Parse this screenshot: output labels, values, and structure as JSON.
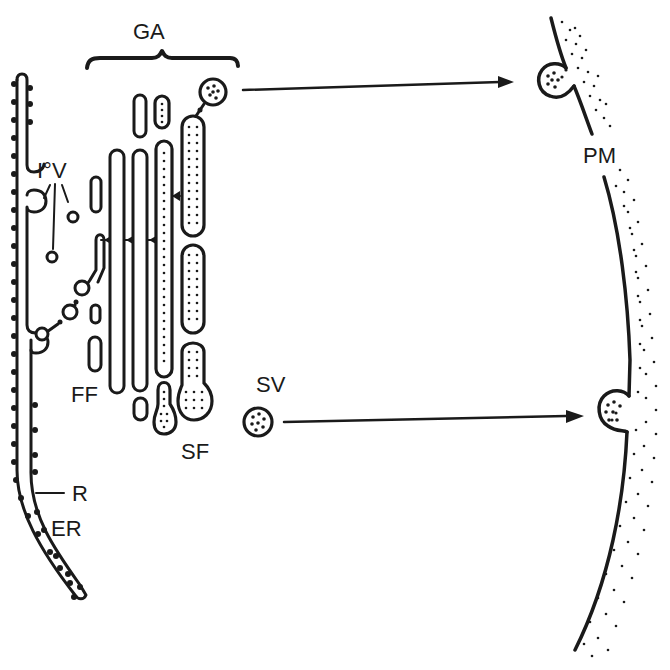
{
  "diagram": {
    "type": "cell-biology schematic",
    "colors": {
      "ink": "#1a1a1a",
      "background": "#ffffff"
    },
    "labels": {
      "golgi_apparatus": "GA",
      "intermediate_vesicles": "I°V",
      "plasma_membrane": "PM",
      "forming_face": "FF",
      "secretory_face": "SF",
      "secretory_vesicle": "SV",
      "ribosome": "R",
      "endoplasmic_reticulum": "ER"
    },
    "components": [
      {
        "id": "ER",
        "name": "Rough endoplasmic reticulum with ribosomes",
        "position": "left edge"
      },
      {
        "id": "I°V",
        "name": "Intermediate (transition) vesicles",
        "position": "between ER and Golgi"
      },
      {
        "id": "GA",
        "name": "Golgi apparatus stack of cisternae",
        "position": "center-left",
        "bracket": "curly brace above"
      },
      {
        "id": "FF",
        "name": "Forming (cis) face",
        "position": "left side of Golgi stack"
      },
      {
        "id": "SF",
        "name": "Secretory (trans) face with dotted cisternae",
        "position": "right side of Golgi stack"
      },
      {
        "id": "SV",
        "name": "Secretory vesicle with content granules",
        "position": "center"
      },
      {
        "id": "PM",
        "name": "Plasma membrane, stippled extracellular side",
        "position": "right edge, curved"
      }
    ],
    "arrows": [
      {
        "from": "upper secretory vesicle (Golgi top)",
        "to": "plasma membrane fusion site (upper)"
      },
      {
        "from": "SV",
        "to": "plasma membrane fusion site (lower)"
      }
    ]
  }
}
